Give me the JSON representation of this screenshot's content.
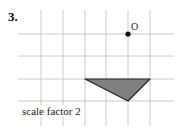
{
  "question": {
    "number": "3."
  },
  "diagram": {
    "grid": {
      "vertical_x": [
        41,
        63,
        85,
        106,
        128,
        150
      ],
      "horizontal_y": [
        34,
        56,
        79,
        101
      ],
      "color": "#c8c8c8"
    },
    "center_point": {
      "label": "O",
      "x": 128,
      "y": 34
    },
    "triangle": {
      "points": "85,79 150,79 128,101",
      "fill": "#808080",
      "stroke": "#222222"
    },
    "caption": "scale factor 2"
  }
}
